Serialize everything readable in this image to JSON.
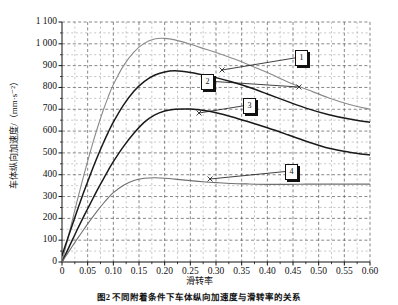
{
  "chart_data": {
    "type": "line",
    "title": "图2  不同附着条件下车体纵向加速度与滑转率的关系",
    "xlabel": "滑转率",
    "ylabel": "车体纵向加速度/（mm·s⁻²）",
    "xlim": [
      0,
      0.6
    ],
    "ylim": [
      0,
      1100
    ],
    "grid": true,
    "legend_position": "inline-callouts",
    "xticks": [
      "0",
      "0.05",
      "0.10",
      "0.15",
      "0.20",
      "0.25",
      "0.30",
      "0.35",
      "0.40",
      "0.45",
      "0.50",
      "0.55",
      "0.60"
    ],
    "xtick_values": [
      0,
      0.05,
      0.1,
      0.15,
      0.2,
      0.25,
      0.3,
      0.35,
      0.4,
      0.45,
      0.5,
      0.55,
      0.6
    ],
    "yticks": [
      "0",
      "100",
      "200",
      "300",
      "400",
      "500",
      "600",
      "700",
      "800",
      "900",
      "1 000",
      "1 100"
    ],
    "ytick_values": [
      0,
      100,
      200,
      300,
      400,
      500,
      600,
      700,
      800,
      900,
      1000,
      1100
    ],
    "x": [
      0,
      0.01,
      0.02,
      0.03,
      0.04,
      0.05,
      0.06,
      0.07,
      0.08,
      0.09,
      0.1,
      0.12,
      0.14,
      0.16,
      0.18,
      0.2,
      0.22,
      0.25,
      0.28,
      0.3,
      0.33,
      0.36,
      0.4,
      0.44,
      0.48,
      0.52,
      0.56,
      0.6
    ],
    "series": [
      {
        "name": "1",
        "label": "1",
        "color": "#8a8a8a",
        "peak_value": 1025,
        "peak_x": 0.17,
        "end_value": 700,
        "values": [
          0,
          95,
          190,
          285,
          375,
          462,
          545,
          622,
          693,
          757,
          813,
          900,
          962,
          1002,
          1022,
          1025,
          1018,
          998,
          975,
          960,
          935,
          908,
          868,
          825,
          788,
          752,
          722,
          700
        ]
      },
      {
        "name": "2",
        "label": "2",
        "color": "#1a1a1a",
        "peak_value": 876,
        "peak_x": 0.22,
        "end_value": 640,
        "values": [
          30,
          100,
          170,
          238,
          305,
          368,
          430,
          488,
          543,
          594,
          641,
          720,
          783,
          827,
          856,
          871,
          876,
          869,
          855,
          845,
          826,
          804,
          770,
          735,
          702,
          675,
          655,
          640
        ]
      },
      {
        "name": "3",
        "label": "3",
        "color": "#1a1a1a",
        "peak_value": 701,
        "peak_x": 0.25,
        "end_value": 490,
        "values": [
          0,
          50,
          100,
          150,
          198,
          244,
          290,
          335,
          378,
          420,
          460,
          530,
          590,
          640,
          673,
          692,
          700,
          701,
          693,
          684,
          666,
          645,
          615,
          583,
          550,
          521,
          503,
          490
        ]
      },
      {
        "name": "4",
        "label": "4",
        "color": "#6f6f6f",
        "peak_value": 386,
        "peak_x": 0.17,
        "end_value": 357,
        "values": [
          0,
          36,
          72,
          107,
          141,
          175,
          207,
          238,
          267,
          294,
          318,
          352,
          374,
          384,
          386,
          384,
          380,
          373,
          367,
          364,
          360,
          358,
          356,
          356,
          357,
          357,
          357,
          357
        ]
      }
    ],
    "callouts": [
      {
        "id": "callout-1",
        "label": "1",
        "x_px": 295,
        "y_px": 50,
        "anchor_x_px": 222,
        "anchor_y_px": 70
      },
      {
        "id": "callout-2",
        "label": "2",
        "x_px": 201,
        "y_px": 74,
        "anchor_x_px": 299,
        "anchor_y_px": 87
      },
      {
        "id": "callout-3",
        "label": "3",
        "x_px": 243,
        "y_px": 98,
        "anchor_x_px": 199,
        "anchor_y_px": 113
      },
      {
        "id": "callout-4",
        "label": "4",
        "x_px": 285,
        "y_px": 164,
        "anchor_x_px": 210,
        "anchor_y_px": 179
      }
    ]
  }
}
